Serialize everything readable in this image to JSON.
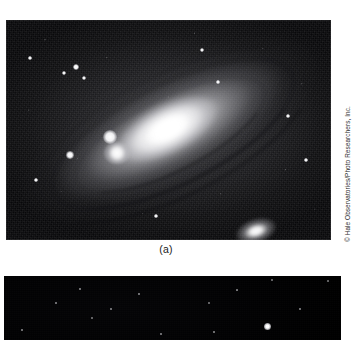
{
  "figure": {
    "panel_a": {
      "caption": "(a)",
      "subject": "Andromeda Galaxy (M31) spiral galaxy photograph",
      "credit": "© Hale Observatories/Photo Researchers, Inc.",
      "objects": {
        "main_galaxy": "andromeda-galaxy-m31",
        "companion_1": "companion-galaxy-m32",
        "companion_2": "companion-galaxy-m110"
      },
      "foreground_stars": [
        {
          "x": 70,
          "y": 47,
          "size": 3.0
        },
        {
          "x": 78,
          "y": 58,
          "size": 2.2
        },
        {
          "x": 58,
          "y": 53,
          "size": 1.8
        },
        {
          "x": 24,
          "y": 38,
          "size": 1.6
        },
        {
          "x": 104,
          "y": 117,
          "size": 6.5
        },
        {
          "x": 64,
          "y": 135,
          "size": 3.4
        },
        {
          "x": 196,
          "y": 30,
          "size": 1.8
        },
        {
          "x": 282,
          "y": 96,
          "size": 1.6
        },
        {
          "x": 300,
          "y": 140,
          "size": 1.5
        },
        {
          "x": 30,
          "y": 160,
          "size": 1.5
        },
        {
          "x": 150,
          "y": 196,
          "size": 1.5
        },
        {
          "x": 212,
          "y": 62,
          "size": 1.4
        }
      ],
      "bounds": {
        "left": 6,
        "top": 20,
        "width": 325,
        "height": 220
      }
    },
    "panel_b": {
      "subject": "dark night sky star field photograph",
      "bounds": {
        "left": 4,
        "top": 276,
        "width": 337,
        "height": 64
      },
      "stars": [
        {
          "x": 263,
          "y": 50,
          "size": 7.0,
          "bright": true
        },
        {
          "x": 268,
          "y": 4,
          "size": 2.6,
          "bright": false
        },
        {
          "x": 324,
          "y": 5,
          "size": 2.0,
          "bright": false
        },
        {
          "x": 88,
          "y": 42,
          "size": 2.4,
          "bright": false
        },
        {
          "x": 205,
          "y": 27,
          "size": 2.0,
          "bright": false
        },
        {
          "x": 233,
          "y": 14,
          "size": 1.7,
          "bright": false
        },
        {
          "x": 107,
          "y": 33,
          "size": 1.6,
          "bright": false
        },
        {
          "x": 52,
          "y": 27,
          "size": 1.5,
          "bright": false
        },
        {
          "x": 18,
          "y": 54,
          "size": 1.6,
          "bright": false
        },
        {
          "x": 157,
          "y": 58,
          "size": 1.6,
          "bright": false
        },
        {
          "x": 210,
          "y": 56,
          "size": 1.5,
          "bright": false
        },
        {
          "x": 296,
          "y": 33,
          "size": 1.4,
          "bright": false
        },
        {
          "x": 135,
          "y": 18,
          "size": 1.3,
          "bright": false
        },
        {
          "x": 76,
          "y": 13,
          "size": 1.3,
          "bright": false
        }
      ]
    }
  },
  "colors": {
    "page_background": "#ffffff",
    "caption_text": "#1a1a1a",
    "credit_text": "#2b2b2b",
    "panel_a_sky": "#0c0c0e",
    "panel_b_sky": "#000000"
  }
}
